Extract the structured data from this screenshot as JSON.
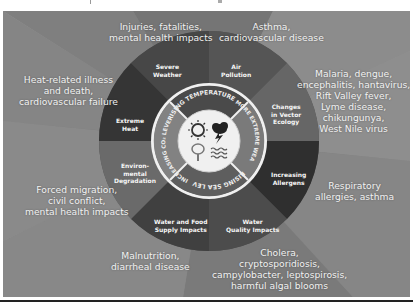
{
  "diagram": {
    "title": "",
    "colors": {
      "background_base": "#8a8a8a",
      "ring_dark": "#3a3a3a",
      "ring_mid": "#5a5a5a",
      "arrow_fill": "#6e6e6e",
      "arrow_dark": "#454545",
      "center_circle": "#f2f2f2",
      "text": "#f2f2f2"
    },
    "center_drivers": [
      {
        "label": "RISING TEMPERATURES",
        "icon": "sun-icon"
      },
      {
        "label": "MORE EXTREME WEATHER",
        "icon": "storm-cloud-icon"
      },
      {
        "label": "RISING SEA LEVELS",
        "icon": "waves-icon"
      },
      {
        "label": "INCREASING CO₂ LEVELS",
        "icon": "tree-icon"
      }
    ],
    "impact_pathways": [
      {
        "pathway": [
          "Severe",
          "Weather"
        ],
        "health_effects": [
          "Injuries, fatalities,",
          "mental health impacts"
        ]
      },
      {
        "pathway": [
          "Air",
          "Pollution"
        ],
        "health_effects": [
          "Asthma,",
          "cardiovascular disease"
        ]
      },
      {
        "pathway": [
          "Changes",
          "in Vector",
          "Ecology"
        ],
        "health_effects": [
          "Malaria, dengue,",
          "encephalitis, hantavirus,",
          "Rift Valley fever,",
          "Lyme disease,",
          "chikungunya,",
          "West Nile virus"
        ]
      },
      {
        "pathway": [
          "Increasing",
          "Allergens"
        ],
        "health_effects": [
          "Respiratory",
          "allergies, asthma"
        ]
      },
      {
        "pathway": [
          "Water",
          "Quality Impacts"
        ],
        "health_effects": [
          "Cholera,",
          "cryptosporidiosis,",
          "campylobacter, leptospirosis,",
          "harmful algal blooms"
        ]
      },
      {
        "pathway": [
          "Water and Food",
          "Supply Impacts"
        ],
        "health_effects": [
          "Malnutrition,",
          "diarrheal disease"
        ]
      },
      {
        "pathway": [
          "Environ-",
          "mental",
          "Degradation"
        ],
        "health_effects": [
          "Forced migration,",
          "civil conflict,",
          "mental health impacts"
        ]
      },
      {
        "pathway": [
          "Extreme",
          "Heat"
        ],
        "health_effects": [
          "Heat-related illness",
          "and death,",
          "cardiovascular failure"
        ]
      }
    ]
  }
}
